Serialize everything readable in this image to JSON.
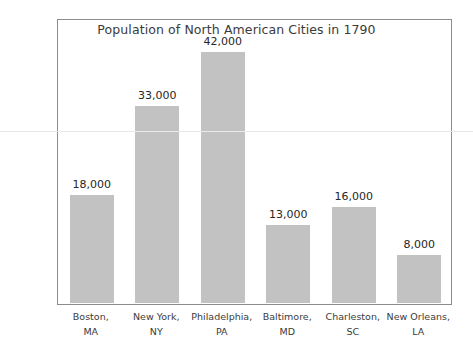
{
  "chart_data": {
    "type": "bar",
    "title": "Population of North American Cities in 1790",
    "xlabel": "",
    "ylabel": "",
    "ylim": [
      0,
      47500
    ],
    "grid": false,
    "legend": false,
    "categories": [
      "Boston, MA",
      "New York, NY",
      "Philadelphia, PA",
      "Baltimore, MD",
      "Charleston, SC",
      "New Orleans, LA"
    ],
    "category_lines": [
      [
        "Boston,",
        "MA"
      ],
      [
        "New York,",
        "NY"
      ],
      [
        "Philadelphia,",
        "PA"
      ],
      [
        "Baltimore,",
        "MD"
      ],
      [
        "Charleston,",
        "SC"
      ],
      [
        "New Orleans,",
        "LA"
      ]
    ],
    "values": [
      18000,
      33000,
      42000,
      13000,
      16000,
      8000
    ],
    "value_labels": [
      "18,000",
      "33,000",
      "42,000",
      "13,000",
      "16,000",
      "8,000"
    ],
    "y_ticks": [
      0,
      5000,
      10000,
      15000,
      20000,
      25000,
      30000,
      35000,
      40000,
      45000
    ],
    "y_tick_labels": [
      "0",
      "5,000",
      "10,000",
      "15,000",
      "20,000",
      "25,000",
      "30,000",
      "35,000",
      "40,000",
      "45,000"
    ],
    "colors": {
      "bar_fill": "#c2c2c2",
      "frame": "#8c8c8c",
      "text": "#3b3b3b",
      "value_text": "#262626",
      "background": "#ffffff",
      "artifact_rule": "#e9e9e9"
    },
    "artifact_rule_value": 29000
  }
}
